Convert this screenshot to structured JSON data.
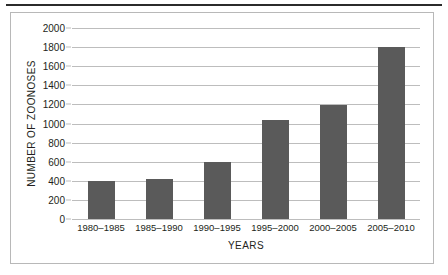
{
  "chart_data": {
    "type": "bar",
    "title": "",
    "xlabel": "YEARS",
    "ylabel": "NUMBER OF ZOONOSES",
    "categories": [
      "1980–1985",
      "1985–1990",
      "1990–1995",
      "1995–2000",
      "2000–2005",
      "2005–2010"
    ],
    "values": [
      400,
      420,
      600,
      1040,
      1190,
      1800
    ],
    "ylim": [
      0,
      2000
    ],
    "yticks": [
      0,
      200,
      400,
      600,
      800,
      1000,
      1200,
      1400,
      1600,
      1800,
      2000
    ],
    "ytick_labels": [
      "0",
      "200",
      "400",
      "600",
      "800",
      "1000",
      "1200",
      "1400",
      "1600",
      "1800",
      "2000"
    ],
    "grid": true,
    "legend": "none",
    "bar_color": "#5a5a5a",
    "grid_color": "#bdbdbd",
    "text_color": "#231f20",
    "frame_color": "#b8b8b8",
    "rule_color": "#2b2b2b"
  }
}
